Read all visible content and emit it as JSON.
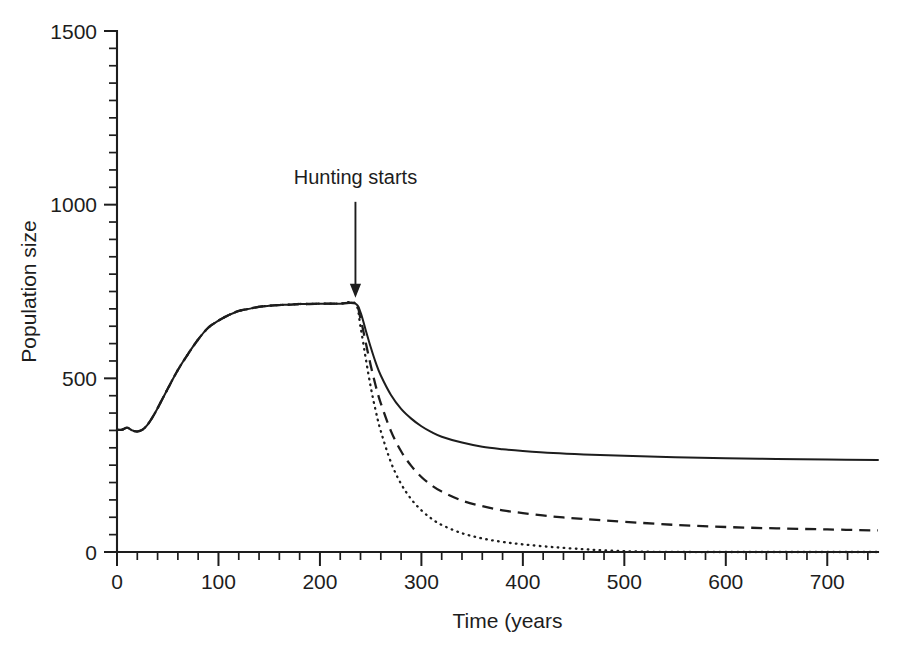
{
  "chart_data": {
    "type": "line",
    "title": "",
    "subtitle": "",
    "xlabel": "Time (years",
    "ylabel": "Population size",
    "xlim": [
      0,
      750
    ],
    "ylim": [
      0,
      1500
    ],
    "grid": false,
    "legend": "none",
    "x_major_ticks": [
      0,
      100,
      200,
      300,
      400,
      500,
      600,
      700
    ],
    "x_major_tick_labels": [
      "0",
      "100",
      "200",
      "300",
      "400",
      "500",
      "600",
      "700"
    ],
    "x_minor_tick_interval": 20,
    "y_major_ticks": [
      0,
      500,
      1000,
      1500
    ],
    "y_major_tick_labels": [
      "0",
      "500",
      "1000",
      "1500"
    ],
    "y_minor_tick_interval": 50,
    "annotations": [
      {
        "name": "hunting-starts",
        "text": "Hunting starts",
        "x": 235,
        "y": 715,
        "label_x": 235,
        "label_y": 1060,
        "arrow": "down"
      }
    ],
    "hunting_start_year": 235,
    "carrying_capacity": 715,
    "series": [
      {
        "name": "low-hunting-pressure",
        "style": "solid",
        "color": "#1d1d1d",
        "final_value": 265,
        "x": [
          0,
          5,
          10,
          15,
          20,
          25,
          30,
          35,
          40,
          50,
          60,
          70,
          80,
          90,
          100,
          110,
          120,
          130,
          140,
          150,
          160,
          170,
          180,
          190,
          200,
          210,
          220,
          235,
          240,
          245,
          250,
          255,
          260,
          270,
          280,
          290,
          300,
          310,
          320,
          340,
          360,
          380,
          400,
          430,
          460,
          500,
          550,
          600,
          650,
          700,
          750
        ],
        "values": [
          352,
          352,
          358,
          350,
          347,
          352,
          366,
          388,
          414,
          470,
          524,
          570,
          612,
          646,
          666,
          682,
          694,
          700,
          706,
          709,
          711,
          712,
          714,
          714,
          715,
          715,
          715,
          715,
          690,
          640,
          590,
          545,
          508,
          452,
          412,
          384,
          362,
          345,
          332,
          315,
          303,
          296,
          291,
          285,
          281,
          277,
          273,
          270,
          268,
          266,
          265
        ]
      },
      {
        "name": "medium-hunting-pressure",
        "style": "dashed",
        "color": "#1d1d1d",
        "final_value": 62,
        "x": [
          0,
          5,
          10,
          15,
          20,
          25,
          30,
          35,
          40,
          50,
          60,
          70,
          80,
          90,
          100,
          110,
          120,
          130,
          140,
          150,
          160,
          170,
          180,
          190,
          200,
          210,
          220,
          235,
          240,
          245,
          250,
          255,
          260,
          270,
          280,
          290,
          300,
          310,
          320,
          340,
          360,
          380,
          400,
          430,
          460,
          500,
          550,
          600,
          650,
          700,
          750
        ],
        "values": [
          352,
          352,
          358,
          350,
          347,
          352,
          366,
          388,
          414,
          470,
          524,
          570,
          612,
          646,
          666,
          682,
          694,
          700,
          706,
          709,
          711,
          712,
          714,
          714,
          715,
          715,
          715,
          715,
          672,
          605,
          538,
          478,
          428,
          348,
          290,
          248,
          216,
          192,
          174,
          148,
          132,
          120,
          112,
          102,
          95,
          87,
          78,
          72,
          68,
          65,
          62
        ]
      },
      {
        "name": "high-hunting-pressure",
        "style": "dotted",
        "color": "#1d1d1d",
        "final_value": 0,
        "extinction_year": 485,
        "x": [
          0,
          5,
          10,
          15,
          20,
          25,
          30,
          35,
          40,
          50,
          60,
          70,
          80,
          90,
          100,
          110,
          120,
          130,
          140,
          150,
          160,
          170,
          180,
          190,
          200,
          210,
          220,
          235,
          240,
          245,
          250,
          255,
          260,
          270,
          280,
          290,
          300,
          310,
          320,
          340,
          360,
          380,
          400,
          430,
          460,
          485,
          520,
          560,
          600,
          650,
          700,
          750
        ],
        "values": [
          352,
          352,
          358,
          350,
          347,
          352,
          366,
          388,
          414,
          470,
          524,
          570,
          612,
          646,
          666,
          682,
          694,
          700,
          706,
          709,
          711,
          712,
          714,
          714,
          715,
          715,
          715,
          715,
          648,
          560,
          476,
          406,
          348,
          258,
          196,
          152,
          120,
          96,
          78,
          54,
          39,
          29,
          22,
          14,
          8,
          4,
          1,
          0,
          0,
          0,
          0,
          0
        ]
      }
    ]
  },
  "figure": {
    "background_color": "#ffffff",
    "foreground_color": "#1d1d1d"
  }
}
